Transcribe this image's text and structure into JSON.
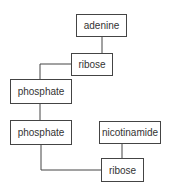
{
  "diagram": {
    "title": "",
    "nodes": [
      {
        "id": "adenine",
        "label": "adenine"
      },
      {
        "id": "ribose_top",
        "label": "ribose"
      },
      {
        "id": "phosphate_1",
        "label": "phosphate"
      },
      {
        "id": "phosphate_2",
        "label": "phosphate"
      },
      {
        "id": "nicotinamide",
        "label": "nicotinamide"
      },
      {
        "id": "ribose_bottom",
        "label": "ribose"
      }
    ],
    "edges": [
      [
        "adenine",
        "ribose_top"
      ],
      [
        "ribose_top",
        "phosphate_1"
      ],
      [
        "phosphate_1",
        "phosphate_2"
      ],
      [
        "phosphate_2",
        "ribose_bottom"
      ],
      [
        "nicotinamide",
        "ribose_bottom"
      ]
    ],
    "colors": {
      "line": "#444444",
      "text": "#333333",
      "background": "#ffffff"
    }
  }
}
